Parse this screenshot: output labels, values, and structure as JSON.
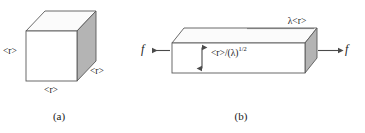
{
  "figure": {
    "background_color": "#ffffff",
    "line_color": "#5a5a5a",
    "face_front_color": "#ffffff",
    "face_top_color": "#fbfbfb",
    "face_side_color": "#b4b4b4",
    "arrow_color": "#4a4a4a",
    "text_color": "#1a1a1a"
  },
  "panel_a": {
    "caption": "(a)",
    "shape": "cube",
    "labels": {
      "left_edge": "<r>",
      "bottom_edge": "<r>",
      "right_edge": "<r>"
    }
  },
  "panel_b": {
    "caption": "(b)",
    "shape": "elongated-box",
    "labels": {
      "top_edge": "λ<r>",
      "height_base": "<r>/(λ)",
      "height_exponent": "1/2",
      "force_left": "f",
      "force_right": "f"
    },
    "arrows": {
      "left_force_direction": "left",
      "right_force_direction": "right",
      "height_indicator": "double-vertical"
    }
  }
}
